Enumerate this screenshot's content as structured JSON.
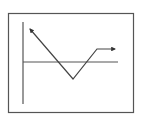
{
  "diagram": {
    "type": "line-path-sketch",
    "colors": {
      "frame": "#555555",
      "axis": "#555555",
      "path": "#444444",
      "background": "#ffffff"
    },
    "frame": {
      "x": 8.5,
      "y": 13.5,
      "width": 125,
      "height": 99
    },
    "vertical_axis": {
      "x": 23,
      "y1": 22,
      "y2": 104
    },
    "horizontal_line": {
      "y": 62,
      "x1": 23,
      "x2": 118
    },
    "path_points": [
      [
        30,
        29
      ],
      [
        73,
        79
      ],
      [
        97,
        49
      ],
      [
        115,
        49
      ]
    ],
    "arrowheads": [
      "start",
      "end"
    ]
  }
}
